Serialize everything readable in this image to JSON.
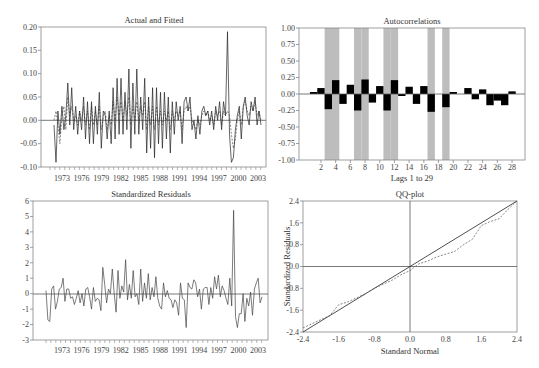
{
  "chart_data": [
    {
      "id": "actual_fitted",
      "type": "line",
      "title": "Actual and Fitted",
      "xlabel": "",
      "ylabel": "",
      "ylim": [
        -0.1,
        0.2
      ],
      "yticks": [
        "0.20",
        "0.15",
        "0.10",
        "0.05",
        "0.00",
        "-0.05",
        "-0.10"
      ],
      "xticks": [
        "1973",
        "1976",
        "1979",
        "1982",
        "1985",
        "1988",
        "1991",
        "1994",
        "1997",
        "2000",
        "2003"
      ],
      "grid": false,
      "legend": "none",
      "series": [
        {
          "name": "Actual",
          "style": "solid",
          "values": [
            -0.01,
            -0.09,
            0.02,
            -0.03,
            0.03,
            -0.02,
            0.01,
            0.08,
            -0.01,
            0.07,
            -0.02,
            0.03,
            -0.03,
            0.02,
            -0.02,
            0.05,
            -0.04,
            0.04,
            -0.05,
            0.04,
            -0.05,
            0.03,
            -0.03,
            0.06,
            -0.06,
            0.02,
            0.01,
            -0.04,
            0.02,
            -0.05,
            0.07,
            -0.04,
            0.09,
            -0.03,
            0.09,
            -0.03,
            0.06,
            -0.02,
            0.11,
            -0.06,
            0.08,
            -0.03,
            0.11,
            -0.03,
            0.05,
            -0.02,
            0.09,
            -0.07,
            0.05,
            -0.06,
            0.07,
            -0.08,
            0.07,
            -0.05,
            0.06,
            -0.06,
            0.06,
            -0.04,
            0.05,
            -0.07,
            0.04,
            -0.03,
            0.04,
            0.0,
            0.03,
            -0.05,
            0.04,
            0.05,
            0.02,
            0.05,
            -0.02,
            0.0,
            -0.04,
            0.01,
            -0.03,
            0.02,
            0.03,
            0.01,
            0.02,
            -0.01,
            0.02,
            -0.02,
            0.03,
            0.0,
            0.04,
            -0.02,
            0.04,
            0.01,
            0.19,
            -0.03,
            -0.09,
            -0.08,
            -0.02,
            0.01,
            0.03,
            -0.04,
            0.03,
            0.05,
            0.01,
            -0.01,
            0.04,
            0.02,
            0.05,
            -0.01,
            0.02,
            -0.01
          ]
        },
        {
          "name": "Fitted",
          "style": "dashed",
          "values": [
            0.0,
            0.02,
            -0.01,
            -0.05,
            0.01,
            0.03,
            -0.02,
            0.05,
            0.01,
            0.03,
            0.0,
            0.01,
            -0.01,
            0.02,
            0.0,
            0.03,
            -0.01,
            0.02,
            -0.02,
            0.03,
            -0.01,
            0.02,
            -0.01,
            0.03,
            -0.02,
            0.01,
            0.02,
            -0.02,
            0.01,
            -0.01,
            0.04,
            0.0,
            0.05,
            0.01,
            0.04,
            0.0,
            0.04,
            0.01,
            0.05,
            -0.01,
            0.03,
            0.0,
            0.04,
            0.0,
            0.03,
            0.01,
            0.04,
            -0.02,
            0.03,
            -0.01,
            0.03,
            -0.02,
            0.03,
            -0.01,
            0.02,
            -0.01,
            0.02,
            0.0,
            0.02,
            -0.02,
            0.02,
            0.0,
            0.02,
            0.01,
            0.02,
            -0.02,
            0.02,
            0.03,
            0.02,
            0.03,
            0.0,
            -0.01,
            -0.02,
            0.0,
            -0.01,
            0.01,
            0.02,
            0.01,
            0.02,
            0.0,
            0.01,
            -0.01,
            0.02,
            0.01,
            0.02,
            -0.01,
            0.02,
            0.01,
            0.02,
            0.01,
            -0.03,
            -0.06,
            -0.04,
            0.0,
            0.02,
            -0.01,
            0.03,
            0.04,
            0.02,
            0.01,
            0.03,
            0.02,
            0.04,
            0.01,
            0.02,
            0.0
          ]
        }
      ]
    },
    {
      "id": "autocorrelations",
      "type": "bar",
      "title": "Autocorrelations",
      "xlabel": "Lags 1 to 29",
      "ylabel": "",
      "ylim": [
        -1.0,
        1.0
      ],
      "yticks": [
        "1.00",
        "0.75",
        "0.50",
        "0.25",
        "0.00",
        "-0.25",
        "-0.50",
        "-0.75",
        "-1.00"
      ],
      "xticks": [
        "2",
        "4",
        "6",
        "8",
        "10",
        "12",
        "14",
        "16",
        "18",
        "20",
        "22",
        "24",
        "26",
        "28"
      ],
      "categories": [
        1,
        2,
        3,
        4,
        5,
        6,
        7,
        8,
        9,
        10,
        11,
        12,
        13,
        14,
        15,
        16,
        17,
        18,
        19,
        20,
        21,
        22,
        23,
        24,
        25,
        26,
        27,
        28,
        29
      ],
      "values": [
        0.03,
        0.09,
        -0.23,
        0.21,
        -0.15,
        0.14,
        -0.25,
        0.22,
        -0.13,
        0.12,
        -0.25,
        0.21,
        -0.03,
        0.11,
        -0.15,
        0.12,
        -0.27,
        0.0,
        -0.2,
        0.03,
        0.0,
        0.09,
        -0.08,
        0.07,
        -0.17,
        -0.1,
        -0.17,
        0.04,
        0.0
      ],
      "highlighted_lags": [
        3,
        4,
        7,
        8,
        11,
        12,
        17,
        19
      ],
      "highlight_color": "#bdbdbd",
      "bar_color": "#000000",
      "grid": false
    },
    {
      "id": "standardized_residuals",
      "type": "line",
      "title": "Standardized Residuals",
      "xlabel": "",
      "ylabel": "",
      "ylim": [
        -3,
        6
      ],
      "yticks": [
        "6",
        "5",
        "4",
        "3",
        "2",
        "1",
        "0",
        "-1",
        "-2",
        "-3"
      ],
      "xticks": [
        "1973",
        "1976",
        "1979",
        "1982",
        "1985",
        "1988",
        "1991",
        "1994",
        "1997",
        "2000",
        "2003"
      ],
      "grid": false,
      "series": [
        {
          "name": "Standardized Residuals",
          "style": "solid",
          "values": [
            0.2,
            -1.7,
            -1.8,
            0.3,
            0.5,
            -1.0,
            -0.5,
            0.3,
            0.4,
            1.0,
            -0.5,
            0.3,
            0.3,
            -0.3,
            -0.2,
            -0.7,
            -0.3,
            0.2,
            -0.6,
            0.0,
            -0.8,
            0.3,
            0.4,
            -0.2,
            -1.0,
            0.4,
            -0.5,
            -0.3,
            -0.4,
            -1.1,
            1.7,
            0.6,
            -0.6,
            0.3,
            0.0,
            1.6,
            0.0,
            -1.2,
            1.5,
            -0.3,
            0.5,
            0.1,
            2.2,
            -0.4,
            0.6,
            -0.3,
            1.5,
            -0.2,
            0.0,
            -0.7,
            1.6,
            -0.5,
            0.7,
            -0.3,
            1.3,
            -0.4,
            0.4,
            -0.2,
            1.1,
            -0.3,
            -0.8,
            -1.0,
            0.7,
            -0.2,
            0.2,
            -0.3,
            -0.4,
            -0.9,
            -0.4,
            -0.6,
            -1.4,
            0.7,
            -0.3,
            -0.4,
            -2.2,
            0.7,
            0.4,
            0.3,
            0.9,
            0.7,
            -0.2,
            0.3,
            -1.0,
            0.3,
            0.4,
            0.4,
            -0.7,
            0.4,
            -0.3,
            1.1,
            0.3,
            1.2,
            -0.2,
            0.5,
            0.2,
            -0.3,
            -0.7,
            1.0,
            -0.8,
            5.4,
            -1.5,
            -2.2,
            -1.3,
            -1.3,
            0.0,
            -1.8,
            -0.3,
            -0.8,
            0.1,
            -1.4,
            0.3,
            0.7,
            1.0,
            -0.6,
            -0.2
          ]
        }
      ]
    },
    {
      "id": "qq_plot",
      "type": "line",
      "title": "QQ-plot",
      "xlabel": "Standard Normal",
      "ylabel": "Standardized Residuals",
      "xlim": [
        -2.4,
        2.4
      ],
      "ylim": [
        -2.4,
        2.4
      ],
      "xticks": [
        "-2.4",
        "-1.6",
        "-0.8",
        "0.0",
        "0.8",
        "1.6",
        "2.4"
      ],
      "yticks": [
        "2.4",
        "1.6",
        "0.8",
        "0.0",
        "-0.8",
        "-1.6",
        "-2.4"
      ],
      "grid": false,
      "series": [
        {
          "name": "Reference line",
          "style": "solid",
          "x": [
            -2.4,
            2.4
          ],
          "y": [
            -2.4,
            2.4
          ]
        },
        {
          "name": "Empirical quantiles",
          "style": "dashed",
          "x": [
            -2.4,
            -2.2,
            -2.0,
            -1.8,
            -1.6,
            -1.4,
            -1.2,
            -1.0,
            -0.8,
            -0.6,
            -0.4,
            -0.2,
            0.0,
            0.2,
            0.4,
            0.6,
            0.8,
            1.0,
            1.2,
            1.4,
            1.6,
            1.8,
            2.0,
            2.2,
            2.4
          ],
          "y": [
            -2.25,
            -2.1,
            -1.95,
            -1.8,
            -1.4,
            -1.3,
            -1.15,
            -1.0,
            -0.8,
            -0.65,
            -0.5,
            -0.3,
            -0.15,
            0.1,
            0.2,
            0.35,
            0.45,
            0.55,
            0.8,
            1.0,
            1.5,
            1.65,
            1.75,
            2.1,
            2.4
          ]
        }
      ]
    }
  ]
}
